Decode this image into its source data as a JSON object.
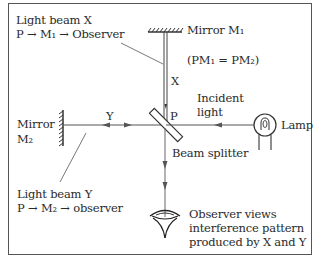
{
  "labels": {
    "beam_x_title": "Light beam X",
    "beam_x_path": "P → M₁ → Observer",
    "mirror_m1": "Mirror M₁",
    "equality": "(PM₁ = PM₂)",
    "x": "X",
    "y": "Y",
    "p": "P",
    "incident_line1": "Incident",
    "incident_line2": "light",
    "lamp": "Lamp",
    "mirror_m2_line1": "Mirror",
    "mirror_m2_line2": "M₂",
    "beam_splitter": "Beam splitter",
    "beam_y_title": "Light beam Y",
    "beam_y_path": "P → M₂ → observer",
    "observer_line1": "Observer views",
    "observer_line2": "interference pattern",
    "observer_line3": "produced by X and Y"
  },
  "colors": {
    "line": "#555555",
    "frame": "#555555",
    "text": "#2a2a2a"
  }
}
